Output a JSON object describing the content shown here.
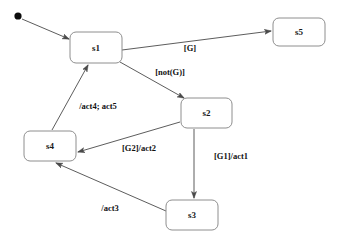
{
  "diagram": {
    "kind": "state-machine-diagram",
    "background_color": "#ffffff",
    "box_fill_color": "#ffffff",
    "box_border_color": "#8e8e8e",
    "edge_color": "#4a4a4a",
    "text_color": "#111111",
    "initial_node": {
      "name": "initial-pseudostate",
      "cx": 18,
      "cy": 16,
      "r": 3.6,
      "color": "#0c0c0c"
    },
    "states": [
      {
        "id": "s1",
        "label": "s1",
        "x": 70,
        "y": 32,
        "w": 52,
        "h": 31
      },
      {
        "id": "s5",
        "label": "s5",
        "x": 273,
        "y": 18,
        "w": 52,
        "h": 28
      },
      {
        "id": "s2",
        "label": "s2",
        "x": 181,
        "y": 98,
        "w": 51,
        "h": 30
      },
      {
        "id": "s4",
        "label": "s4",
        "x": 24,
        "y": 131,
        "w": 52,
        "h": 30
      },
      {
        "id": "s3",
        "label": "s3",
        "x": 166,
        "y": 200,
        "w": 52,
        "h": 30
      }
    ],
    "transitions": [
      {
        "id": "start-to-s1",
        "from": "initial",
        "to": "s1",
        "label": "",
        "x1": 22,
        "y1": 19,
        "x2": 69,
        "y2": 39
      },
      {
        "id": "s1-to-s5",
        "from": "s1",
        "to": "s5",
        "label": "[G]",
        "label_x": 190,
        "label_y": 48,
        "x1": 122,
        "y1": 50,
        "x2": 271,
        "y2": 31
      },
      {
        "id": "s1-to-s2",
        "from": "s1",
        "to": "s2",
        "label": "[not(G)]",
        "label_x": 170,
        "label_y": 72,
        "x1": 120,
        "y1": 62,
        "x2": 184,
        "y2": 98
      },
      {
        "id": "s4-to-s1",
        "from": "s4",
        "to": "s1",
        "label": "/act4; act5",
        "label_x": 98,
        "label_y": 106,
        "x1": 52,
        "y1": 130,
        "x2": 88,
        "y2": 65
      },
      {
        "id": "s2-to-s4",
        "from": "s2",
        "to": "s4",
        "label": "[G2]/act2",
        "label_x": 139,
        "label_y": 148,
        "x1": 180,
        "y1": 122,
        "x2": 78,
        "y2": 152
      },
      {
        "id": "s2-to-s3",
        "from": "s2",
        "to": "s3",
        "label": "[G1]/act1",
        "label_x": 231,
        "label_y": 156,
        "x1": 194,
        "y1": 129,
        "x2": 194,
        "y2": 198
      },
      {
        "id": "s3-to-s4",
        "from": "s3",
        "to": "s4",
        "label": "/act3",
        "label_x": 110,
        "label_y": 208,
        "x1": 166,
        "y1": 211,
        "x2": 56,
        "y2": 163
      }
    ]
  }
}
